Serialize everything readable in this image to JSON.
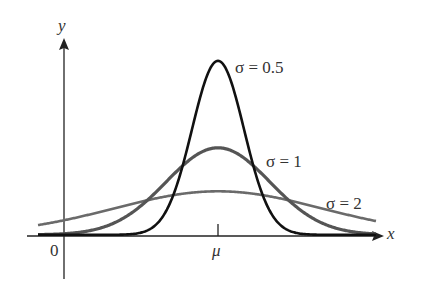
{
  "chart_data": {
    "type": "line",
    "title": "",
    "xlabel": "x",
    "ylabel": "y",
    "x_ticks": [
      {
        "label": "0",
        "value": 0
      },
      {
        "label": "μ",
        "value": "mu"
      }
    ],
    "series": [
      {
        "name": "σ = 0.5",
        "sigma": 0.5,
        "color": "#111111",
        "width": 2.6
      },
      {
        "name": "σ = 1",
        "sigma": 1,
        "color": "#555555",
        "width": 3.2
      },
      {
        "name": "σ = 2",
        "sigma": 2,
        "color": "#6a6a6a",
        "width": 2.6
      }
    ],
    "grid": false,
    "legend": "inline labels next to each curve"
  },
  "labels": {
    "y_axis": "y",
    "x_axis": "x",
    "origin": "0",
    "mu": "μ",
    "sigma_05": "σ = 0.5",
    "sigma_1": "σ = 1",
    "sigma_2": "σ = 2"
  },
  "layout": {
    "origin_px": [
      64,
      236
    ],
    "mu_px": 218,
    "unit_px": 52,
    "x_start": 38,
    "x_end": 376
  }
}
